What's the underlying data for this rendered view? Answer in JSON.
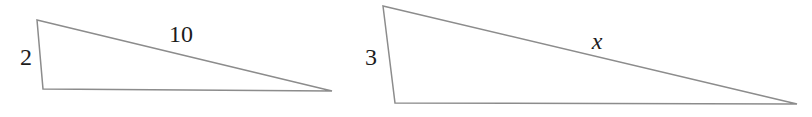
{
  "diagram": {
    "background_color": "#ffffff",
    "stroke_color": "#8c8c8c",
    "label_color": "#1c1c1c",
    "triangles": [
      {
        "name": "small-triangle",
        "points": "37,20 43,89 332,91",
        "labels": [
          {
            "side": "left-side",
            "text": "2"
          },
          {
            "side": "hypotenuse",
            "text": "10"
          }
        ]
      },
      {
        "name": "large-triangle",
        "points": "383,6 395,103 797,104",
        "labels": [
          {
            "side": "left-side",
            "text": "3"
          },
          {
            "side": "hypotenuse",
            "text": "x"
          }
        ]
      }
    ]
  }
}
